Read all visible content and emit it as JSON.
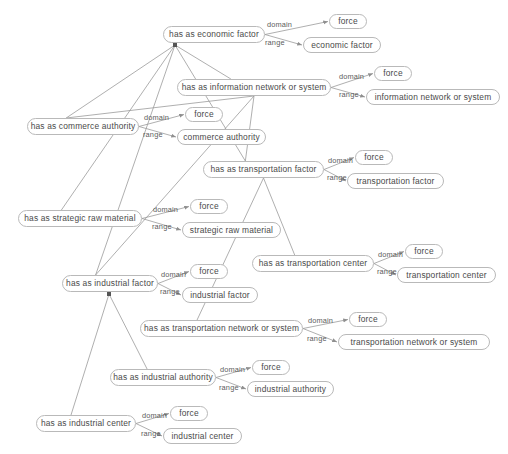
{
  "diagram": {
    "type": "ontology-relation-graph",
    "background": "#ffffff",
    "node_border": "#b9b9b9",
    "node_fill": "#ffffff",
    "text_color": "#4a4a4a",
    "edge_color": "#9a9a9a",
    "edge_labels": {
      "domain": "domain",
      "range": "range"
    },
    "nodes": [
      {
        "id": "n_econ",
        "label": "has as economic factor",
        "x": 163,
        "y": 26,
        "w": 102,
        "h": 17,
        "kind": "property"
      },
      {
        "id": "d_econ",
        "label": "force",
        "x": 329,
        "y": 14,
        "w": 38,
        "h": 15,
        "kind": "class"
      },
      {
        "id": "r_econ",
        "label": "economic factor",
        "x": 303,
        "y": 37,
        "w": 78,
        "h": 16,
        "kind": "class"
      },
      {
        "id": "n_info",
        "label": "has as information network or system",
        "x": 177,
        "y": 79,
        "w": 154,
        "h": 17,
        "kind": "property"
      },
      {
        "id": "d_info",
        "label": "force",
        "x": 374,
        "y": 66,
        "w": 38,
        "h": 15,
        "kind": "class"
      },
      {
        "id": "r_info",
        "label": "information network or system",
        "x": 366,
        "y": 89,
        "w": 134,
        "h": 16,
        "kind": "class"
      },
      {
        "id": "n_comm",
        "label": "has as commerce authority",
        "x": 27,
        "y": 118,
        "w": 112,
        "h": 17,
        "kind": "property"
      },
      {
        "id": "d_comm",
        "label": "force",
        "x": 185,
        "y": 107,
        "w": 38,
        "h": 15,
        "kind": "class"
      },
      {
        "id": "r_comm",
        "label": "commerce authority",
        "x": 177,
        "y": 129,
        "w": 89,
        "h": 16,
        "kind": "class"
      },
      {
        "id": "n_trans",
        "label": "has as transportation factor",
        "x": 203,
        "y": 161,
        "w": 121,
        "h": 17,
        "kind": "property"
      },
      {
        "id": "d_trans",
        "label": "force",
        "x": 355,
        "y": 150,
        "w": 38,
        "h": 15,
        "kind": "class"
      },
      {
        "id": "r_trans",
        "label": "transportation factor",
        "x": 347,
        "y": 173,
        "w": 97,
        "h": 16,
        "kind": "class"
      },
      {
        "id": "n_raw",
        "label": "has as strategic raw material",
        "x": 18,
        "y": 210,
        "w": 124,
        "h": 17,
        "kind": "property"
      },
      {
        "id": "d_raw",
        "label": "force",
        "x": 190,
        "y": 199,
        "w": 38,
        "h": 15,
        "kind": "class"
      },
      {
        "id": "r_raw",
        "label": "strategic raw material",
        "x": 182,
        "y": 222,
        "w": 99,
        "h": 16,
        "kind": "class"
      },
      {
        "id": "n_tcenter",
        "label": "has as transportation center",
        "x": 252,
        "y": 255,
        "w": 122,
        "h": 17,
        "kind": "property"
      },
      {
        "id": "d_tcenter",
        "label": "force",
        "x": 405,
        "y": 244,
        "w": 38,
        "h": 15,
        "kind": "class"
      },
      {
        "id": "r_tcenter",
        "label": "transportation center",
        "x": 397,
        "y": 267,
        "w": 99,
        "h": 16,
        "kind": "class"
      },
      {
        "id": "n_ind",
        "label": "has as industrial factor",
        "x": 62,
        "y": 275,
        "w": 96,
        "h": 17,
        "kind": "property"
      },
      {
        "id": "d_ind",
        "label": "force",
        "x": 190,
        "y": 264,
        "w": 38,
        "h": 15,
        "kind": "class"
      },
      {
        "id": "r_ind",
        "label": "industrial factor",
        "x": 182,
        "y": 287,
        "w": 76,
        "h": 16,
        "kind": "class"
      },
      {
        "id": "n_tnet",
        "label": "has as transportation network or system",
        "x": 140,
        "y": 320,
        "w": 163,
        "h": 17,
        "kind": "property"
      },
      {
        "id": "d_tnet",
        "label": "force",
        "x": 349,
        "y": 312,
        "w": 38,
        "h": 15,
        "kind": "class"
      },
      {
        "id": "r_tnet",
        "label": "transportation network or system",
        "x": 338,
        "y": 334,
        "w": 152,
        "h": 16,
        "kind": "class"
      },
      {
        "id": "n_iauth",
        "label": "has as industrial authority",
        "x": 110,
        "y": 369,
        "w": 106,
        "h": 17,
        "kind": "property"
      },
      {
        "id": "d_iauth",
        "label": "force",
        "x": 252,
        "y": 360,
        "w": 38,
        "h": 15,
        "kind": "class"
      },
      {
        "id": "r_iauth",
        "label": "industrial authority",
        "x": 247,
        "y": 381,
        "w": 87,
        "h": 16,
        "kind": "class"
      },
      {
        "id": "n_icenter",
        "label": "has as industrial center",
        "x": 36,
        "y": 415,
        "w": 100,
        "h": 17,
        "kind": "property"
      },
      {
        "id": "d_icenter",
        "label": "force",
        "x": 170,
        "y": 406,
        "w": 38,
        "h": 15,
        "kind": "class"
      },
      {
        "id": "r_icenter",
        "label": "industrial center",
        "x": 163,
        "y": 428,
        "w": 79,
        "h": 16,
        "kind": "class"
      }
    ],
    "domain_range_pairs": [
      {
        "source": "n_econ",
        "domain": "d_econ",
        "range": "r_econ",
        "dlx": 267,
        "dly": 21,
        "rlx": 265,
        "rly": 39
      },
      {
        "source": "n_info",
        "domain": "d_info",
        "range": "r_info",
        "dlx": 339,
        "dly": 73,
        "rlx": 339,
        "rly": 91
      },
      {
        "source": "n_comm",
        "domain": "d_comm",
        "range": "r_comm",
        "dlx": 144,
        "dly": 114,
        "rlx": 143,
        "rly": 131
      },
      {
        "source": "n_trans",
        "domain": "d_trans",
        "range": "r_trans",
        "dlx": 328,
        "dly": 157,
        "rlx": 327,
        "rly": 174
      },
      {
        "source": "n_raw",
        "domain": "d_raw",
        "range": "r_raw",
        "dlx": 153,
        "dly": 206,
        "rlx": 152,
        "rly": 223
      },
      {
        "source": "n_tcenter",
        "domain": "d_tcenter",
        "range": "r_tcenter",
        "dlx": 378,
        "dly": 251,
        "rlx": 377,
        "rly": 268
      },
      {
        "source": "n_ind",
        "domain": "d_ind",
        "range": "r_ind",
        "dlx": 161,
        "dly": 271,
        "rlx": 160,
        "rly": 288
      },
      {
        "source": "n_tnet",
        "domain": "d_tnet",
        "range": "r_tnet",
        "dlx": 308,
        "dly": 317,
        "rlx": 307,
        "rly": 335
      },
      {
        "source": "n_iauth",
        "domain": "d_iauth",
        "range": "r_iauth",
        "dlx": 220,
        "dly": 366,
        "rlx": 219,
        "rly": 384
      },
      {
        "source": "n_icenter",
        "domain": "d_icenter",
        "range": "r_icenter",
        "dlx": 142,
        "dly": 412,
        "rlx": 141,
        "rly": 430
      }
    ],
    "hierarchy": [
      {
        "parent": "n_econ",
        "child": "n_info"
      },
      {
        "parent": "n_econ",
        "child": "n_comm"
      },
      {
        "parent": "n_econ",
        "child": "n_raw"
      },
      {
        "parent": "n_econ",
        "child": "n_ind"
      },
      {
        "parent": "n_econ",
        "child": "n_trans"
      },
      {
        "parent": "n_info",
        "child": "n_comm"
      },
      {
        "parent": "n_info",
        "child": "n_trans"
      },
      {
        "parent": "n_info",
        "child": "n_ind"
      },
      {
        "parent": "n_trans",
        "child": "n_tcenter"
      },
      {
        "parent": "n_trans",
        "child": "n_tnet"
      },
      {
        "parent": "n_ind",
        "child": "n_iauth"
      },
      {
        "parent": "n_ind",
        "child": "n_icenter"
      }
    ],
    "hubs": [
      {
        "for": "n_econ",
        "x": 175,
        "y": 45
      },
      {
        "for": "n_ind",
        "x": 109,
        "y": 294
      }
    ]
  }
}
